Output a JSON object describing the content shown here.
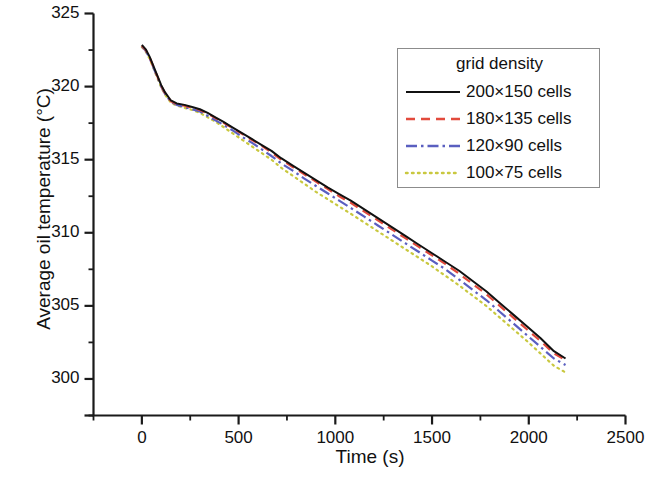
{
  "chart_data": {
    "type": "line",
    "title": "",
    "xlabel": "Time (s)",
    "ylabel": "Average oil temperature (°C)",
    "xlim": [
      -250,
      2500
    ],
    "ylim": [
      297.5,
      325
    ],
    "xticks": [
      0,
      500,
      1000,
      1500,
      2000,
      2500
    ],
    "xtick_labels": [
      "0",
      "500",
      "1000",
      "1500",
      "2000",
      "2500"
    ],
    "yticks": [
      300,
      305,
      310,
      315,
      320,
      325
    ],
    "ytick_labels": [
      "300",
      "305",
      "310",
      "315",
      "320",
      "325"
    ],
    "x_minor_tick_interval": 250,
    "y_minor_tick_interval": 2.5,
    "grid": false,
    "legend_position": "upper right",
    "legend_title": "grid density",
    "axis_color": "#1a1a1a",
    "background": "#ffffff",
    "series": [
      {
        "name": "200×150 cells",
        "color": "#111111",
        "dash": "solid",
        "x": [
          0,
          20,
          40,
          60,
          80,
          100,
          120,
          150,
          180,
          220,
          260,
          300,
          340,
          380,
          420,
          470,
          520,
          570,
          620,
          670,
          720,
          780,
          840,
          900,
          960,
          1020,
          1080,
          1150,
          1220,
          1290,
          1360,
          1430,
          1500,
          1570,
          1640,
          1710,
          1780,
          1850,
          1920,
          1990,
          2060,
          2130,
          2190
        ],
        "y": [
          322.85,
          322.55,
          322.05,
          321.4,
          320.75,
          320.1,
          319.6,
          319.05,
          318.85,
          318.75,
          318.6,
          318.45,
          318.2,
          317.9,
          317.6,
          317.2,
          316.8,
          316.4,
          316.0,
          315.6,
          315.1,
          314.6,
          314.1,
          313.6,
          313.1,
          312.65,
          312.2,
          311.6,
          311.0,
          310.4,
          309.8,
          309.2,
          308.6,
          308.0,
          307.4,
          306.7,
          306.0,
          305.2,
          304.4,
          303.6,
          302.8,
          301.9,
          301.4
        ]
      },
      {
        "name": "180×135 cells",
        "color": "#e24a3c",
        "dash": "dashed",
        "x": [
          0,
          20,
          40,
          60,
          80,
          100,
          120,
          150,
          180,
          220,
          260,
          300,
          340,
          380,
          420,
          470,
          520,
          570,
          620,
          670,
          720,
          780,
          840,
          900,
          960,
          1020,
          1080,
          1150,
          1220,
          1290,
          1360,
          1430,
          1500,
          1570,
          1640,
          1710,
          1780,
          1850,
          1920,
          1990,
          2060,
          2130,
          2190
        ],
        "y": [
          322.8,
          322.5,
          322.0,
          321.35,
          320.7,
          320.05,
          319.55,
          319.0,
          318.8,
          318.7,
          318.55,
          318.4,
          318.15,
          317.85,
          317.55,
          317.15,
          316.75,
          316.35,
          315.95,
          315.5,
          315.0,
          314.5,
          314.0,
          313.5,
          313.0,
          312.5,
          312.05,
          311.45,
          310.85,
          310.25,
          309.65,
          309.05,
          308.45,
          307.85,
          307.2,
          306.5,
          305.8,
          305.0,
          304.2,
          303.4,
          302.6,
          301.75,
          301.3
        ]
      },
      {
        "name": "120×90 cells",
        "color": "#5a5fc0",
        "dash": "dashdot",
        "x": [
          0,
          20,
          40,
          60,
          80,
          100,
          120,
          150,
          180,
          220,
          260,
          300,
          340,
          380,
          420,
          470,
          520,
          570,
          620,
          670,
          720,
          780,
          840,
          900,
          960,
          1020,
          1080,
          1150,
          1220,
          1290,
          1360,
          1430,
          1500,
          1570,
          1640,
          1710,
          1780,
          1850,
          1920,
          1990,
          2060,
          2130,
          2190
        ],
        "y": [
          322.75,
          322.45,
          321.95,
          321.3,
          320.65,
          320.0,
          319.5,
          318.95,
          318.75,
          318.6,
          318.45,
          318.3,
          318.0,
          317.7,
          317.4,
          317.0,
          316.55,
          316.15,
          315.7,
          315.25,
          314.75,
          314.25,
          313.7,
          313.2,
          312.7,
          312.2,
          311.7,
          311.1,
          310.5,
          309.9,
          309.3,
          308.7,
          308.1,
          307.5,
          306.8,
          306.1,
          305.4,
          304.6,
          303.8,
          303.0,
          302.2,
          301.4,
          300.95
        ]
      },
      {
        "name": "100×75 cells",
        "color": "#c9c83f",
        "dash": "dotted",
        "x": [
          0,
          20,
          40,
          60,
          80,
          100,
          120,
          150,
          180,
          220,
          260,
          300,
          340,
          380,
          420,
          470,
          520,
          570,
          620,
          670,
          720,
          780,
          840,
          900,
          960,
          1020,
          1080,
          1150,
          1220,
          1290,
          1360,
          1430,
          1500,
          1570,
          1640,
          1710,
          1780,
          1850,
          1920,
          1990,
          2060,
          2130,
          2190
        ],
        "y": [
          322.7,
          322.4,
          321.9,
          321.25,
          320.6,
          319.95,
          319.45,
          318.9,
          318.7,
          318.55,
          318.4,
          318.2,
          317.9,
          317.6,
          317.25,
          316.8,
          316.35,
          315.9,
          315.45,
          315.0,
          314.45,
          313.9,
          313.35,
          312.8,
          312.3,
          311.8,
          311.3,
          310.7,
          310.1,
          309.5,
          308.9,
          308.3,
          307.7,
          307.05,
          306.4,
          305.7,
          305.0,
          304.2,
          303.4,
          302.6,
          301.75,
          300.9,
          300.45
        ]
      }
    ]
  }
}
